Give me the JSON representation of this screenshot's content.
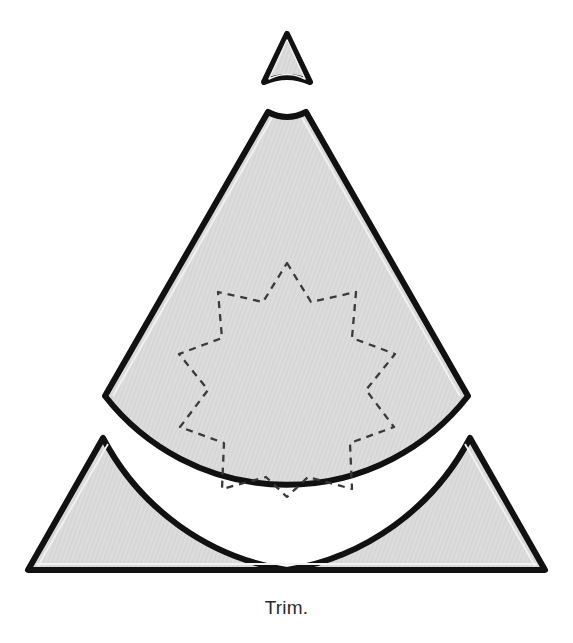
{
  "figure": {
    "caption": "Trim.",
    "title": "Trim.",
    "kind": "papercraft-cut-template",
    "background_color": "#ffffff",
    "piece_fill_color": "#dcdcdc",
    "piece_stroke_color": "#111111",
    "inner_rule_color": "#f2f2f2",
    "cut_line_color": "#3a3a3a",
    "cut_line_style": "dashed",
    "pieces": [
      {
        "id": "tip-piece",
        "label": "tip-piece",
        "description": "small triangular tip with concave bottom arc",
        "apex": [
          287,
          35
        ],
        "left": [
          265,
          82
        ],
        "right": [
          309,
          82
        ],
        "arc_sagitta": 9
      },
      {
        "id": "main-body-piece",
        "label": "main-body-piece",
        "description": "large triangle with truncated concave apex and concave bottom arc",
        "apex_left": [
          268,
          112
        ],
        "apex_right": [
          306,
          112
        ],
        "apex_sagitta": 10,
        "left": [
          105,
          396
        ],
        "right": [
          468,
          396
        ],
        "bottom_arc_sagitta": 158
      },
      {
        "id": "left-corner-piece",
        "label": "left-corner-piece",
        "description": "lower-left corner triangle with concave inner arc",
        "apex": [
          103,
          438
        ],
        "bottom_left": [
          28,
          570
        ],
        "bottom_right": [
          287,
          570
        ]
      },
      {
        "id": "right-corner-piece",
        "label": "right-corner-piece",
        "description": "lower-right corner triangle with concave inner arc",
        "apex": [
          470,
          438
        ],
        "bottom_left": [
          287,
          570
        ],
        "bottom_right": [
          545,
          570
        ]
      }
    ],
    "cut_guide": {
      "id": "star-cut-guide",
      "label": "dashed-star-cut-guide",
      "shape": "nine-pointed-star",
      "points": 9,
      "center": [
        287,
        380
      ],
      "outer_radius": 117,
      "inner_radius": 84,
      "dash": "7 6",
      "stroke_width": 2.2
    }
  }
}
